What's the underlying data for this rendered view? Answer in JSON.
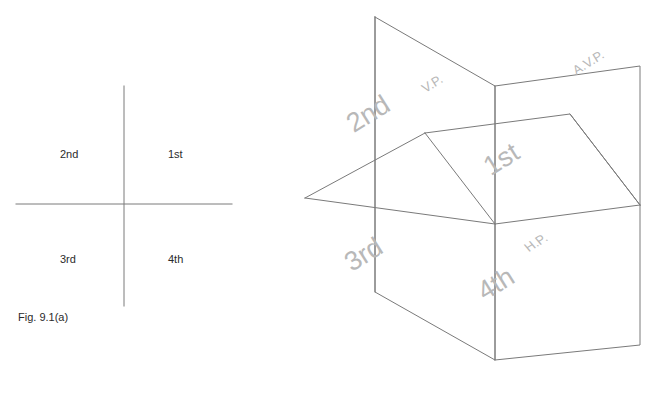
{
  "figure": {
    "caption": "Fig. 9.1(a)",
    "line_color": "#7a7a7a",
    "label_color": "#2b2b2b",
    "pictorial_label_color": "#b8b8b8"
  },
  "quadrant_diagram": {
    "name": "two-dimensional quadrant diagram",
    "labels": {
      "q1": "1st",
      "q2": "2nd",
      "q3": "3rd",
      "q4": "4th"
    }
  },
  "pictorial_diagram": {
    "name": "pictorial view of reference planes",
    "quadrant_labels": {
      "q1": "1st",
      "q2": "2nd",
      "q3": "3rd",
      "q4": "4th"
    },
    "plane_labels": {
      "vp": "V.P.",
      "avp": "A.V.P.",
      "hp": "H.P."
    }
  }
}
